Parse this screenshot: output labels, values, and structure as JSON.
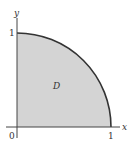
{
  "diagram": {
    "region_label": "D",
    "x_axis_label": "x",
    "y_axis_label": "y",
    "origin_label": "0",
    "x_tick_label": "1",
    "y_tick_label": "1",
    "fill_color": "#d4d4d4",
    "curve_color": "#333333",
    "axis_color": "#444444"
  }
}
